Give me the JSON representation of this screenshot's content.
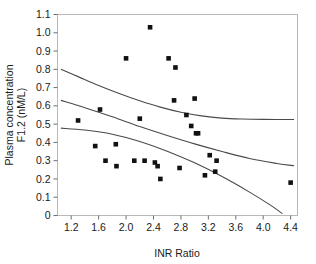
{
  "chart_data": {
    "type": "scatter",
    "title": "",
    "xlabel": "INR Ratio",
    "ylabel_line1": "Plasma concentration",
    "ylabel_line2": "F1.2 (nM/L)",
    "xlim": [
      1.0,
      4.5
    ],
    "ylim": [
      0,
      1.1
    ],
    "xticks": [
      "1.2",
      "1.6",
      "2.0",
      "2.4",
      "2.8",
      "3.2",
      "3.6",
      "4.0",
      "4.4"
    ],
    "xtick_values": [
      1.2,
      1.6,
      2.0,
      2.4,
      2.8,
      3.2,
      3.6,
      4.0,
      4.4
    ],
    "yticks": [
      "0",
      "0.1",
      "0.2",
      "0.3",
      "0.4",
      "0.5",
      "0.6",
      "0.7",
      "0.8",
      "0.9",
      "1.0",
      "1.1"
    ],
    "ytick_values": [
      0,
      0.1,
      0.2,
      0.3,
      0.4,
      0.5,
      0.6,
      0.7,
      0.8,
      0.9,
      1.0,
      1.1
    ],
    "grid": false,
    "legend": "none",
    "marker": "filled-square",
    "points": [
      {
        "x": 1.3,
        "y": 0.52
      },
      {
        "x": 1.55,
        "y": 0.38
      },
      {
        "x": 1.62,
        "y": 0.58
      },
      {
        "x": 1.7,
        "y": 0.3
      },
      {
        "x": 1.85,
        "y": 0.39
      },
      {
        "x": 1.86,
        "y": 0.27
      },
      {
        "x": 2.0,
        "y": 0.86
      },
      {
        "x": 2.12,
        "y": 0.3
      },
      {
        "x": 2.2,
        "y": 0.53
      },
      {
        "x": 2.27,
        "y": 0.3
      },
      {
        "x": 2.35,
        "y": 1.03
      },
      {
        "x": 2.42,
        "y": 0.29
      },
      {
        "x": 2.46,
        "y": 0.27
      },
      {
        "x": 2.5,
        "y": 0.2
      },
      {
        "x": 2.62,
        "y": 0.86
      },
      {
        "x": 2.7,
        "y": 0.63
      },
      {
        "x": 2.72,
        "y": 0.81
      },
      {
        "x": 2.78,
        "y": 0.26
      },
      {
        "x": 2.88,
        "y": 0.55
      },
      {
        "x": 2.95,
        "y": 0.49
      },
      {
        "x": 3.0,
        "y": 0.64
      },
      {
        "x": 3.02,
        "y": 0.45
      },
      {
        "x": 3.05,
        "y": 0.45
      },
      {
        "x": 3.15,
        "y": 0.22
      },
      {
        "x": 3.22,
        "y": 0.33
      },
      {
        "x": 3.3,
        "y": 0.24
      },
      {
        "x": 3.32,
        "y": 0.3
      },
      {
        "x": 4.4,
        "y": 0.18
      }
    ],
    "curves": [
      {
        "name": "upper-confidence-band",
        "points": [
          {
            "x": 1.05,
            "y": 0.8
          },
          {
            "x": 1.3,
            "y": 0.76
          },
          {
            "x": 1.6,
            "y": 0.712
          },
          {
            "x": 1.9,
            "y": 0.668
          },
          {
            "x": 2.2,
            "y": 0.628
          },
          {
            "x": 2.5,
            "y": 0.593
          },
          {
            "x": 2.8,
            "y": 0.565
          },
          {
            "x": 3.1,
            "y": 0.545
          },
          {
            "x": 3.4,
            "y": 0.533
          },
          {
            "x": 3.7,
            "y": 0.528
          },
          {
            "x": 4.0,
            "y": 0.526
          },
          {
            "x": 4.45,
            "y": 0.525
          }
        ]
      },
      {
        "name": "regression-line",
        "points": [
          {
            "x": 1.05,
            "y": 0.63
          },
          {
            "x": 1.4,
            "y": 0.59
          },
          {
            "x": 1.8,
            "y": 0.54
          },
          {
            "x": 2.2,
            "y": 0.487
          },
          {
            "x": 2.6,
            "y": 0.438
          },
          {
            "x": 3.0,
            "y": 0.392
          },
          {
            "x": 3.4,
            "y": 0.35
          },
          {
            "x": 3.8,
            "y": 0.312
          },
          {
            "x": 4.2,
            "y": 0.285
          },
          {
            "x": 4.45,
            "y": 0.272
          }
        ]
      },
      {
        "name": "lower-confidence-band",
        "points": [
          {
            "x": 1.05,
            "y": 0.478
          },
          {
            "x": 1.4,
            "y": 0.468
          },
          {
            "x": 1.8,
            "y": 0.445
          },
          {
            "x": 2.2,
            "y": 0.405
          },
          {
            "x": 2.6,
            "y": 0.352
          },
          {
            "x": 3.0,
            "y": 0.288
          },
          {
            "x": 3.4,
            "y": 0.213
          },
          {
            "x": 3.8,
            "y": 0.128
          },
          {
            "x": 4.1,
            "y": 0.058
          },
          {
            "x": 4.28,
            "y": 0.01
          }
        ]
      }
    ]
  }
}
